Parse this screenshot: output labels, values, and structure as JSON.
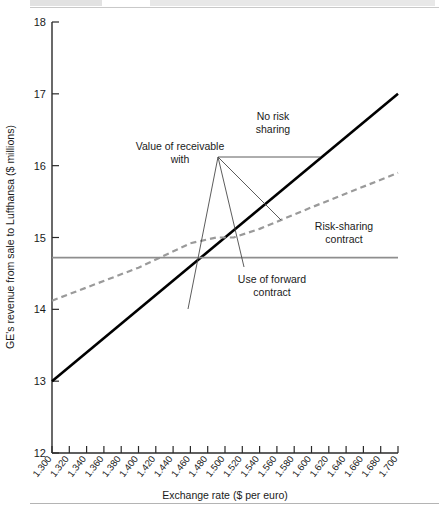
{
  "page": {
    "header_rule_visible": true,
    "footer_rule_visible": true
  },
  "chart_data": {
    "type": "line",
    "title": "",
    "xlabel": "Exchange rate ($ per euro)",
    "ylabel": "GE's revenue from sale to Lufthansa ($ millions)",
    "xlim": [
      1.3,
      1.7
    ],
    "ylim": [
      12,
      18
    ],
    "ytick_step": 1,
    "xtick_step": 0.02,
    "grid": false,
    "legend": "none",
    "yticks": [
      "12",
      "13",
      "14",
      "15",
      "16",
      "17",
      "18"
    ],
    "xticks": [
      "1.300",
      "1.320",
      "1.340",
      "1.360",
      "1.380",
      "1.400",
      "1.420",
      "1.440",
      "1.460",
      "1.480",
      "1.500",
      "1.520",
      "1.540",
      "1.560",
      "1.580",
      "1.600",
      "1.620",
      "1.640",
      "1.660",
      "1.680",
      "1.700"
    ],
    "series": [
      {
        "name": "No risk sharing",
        "style": "solid",
        "color": "#000000",
        "width": 2.6,
        "x": [
          1.3,
          1.7
        ],
        "values": [
          13.0,
          17.0
        ]
      },
      {
        "name": "Risk-sharing contract",
        "style": "dashed",
        "color": "#9a9a9a",
        "width": 2.2,
        "x": [
          1.3,
          1.4,
          1.46,
          1.49,
          1.51,
          1.54,
          1.6,
          1.7
        ],
        "values": [
          14.12,
          14.58,
          14.92,
          15.0,
          15.0,
          15.12,
          15.42,
          15.9
        ]
      },
      {
        "name": "Use of forward contract",
        "style": "solid",
        "color": "#8e8e8e",
        "width": 1.6,
        "x": [
          1.3,
          1.7
        ],
        "values": [
          14.72,
          14.72
        ]
      }
    ],
    "annotations": [
      {
        "id": "value-of-receivable",
        "text_lines": [
          "Value of receivable",
          "with"
        ],
        "x": 1.409,
        "y": 16.3,
        "role": "group-label"
      },
      {
        "id": "no-risk-sharing",
        "text_lines": [
          "No risk",
          "sharing"
        ],
        "x": 1.525,
        "y": 16.73,
        "role": "series-label"
      },
      {
        "id": "risk-sharing-contract",
        "text_lines": [
          "Risk-sharing",
          "contract"
        ],
        "x": 1.612,
        "y": 15.38,
        "role": "series-label"
      },
      {
        "id": "use-of-forward-contract",
        "text_lines": [
          "Use of forward",
          "contract"
        ],
        "x": 1.525,
        "y": 14.42,
        "role": "series-label"
      }
    ],
    "leader_junction": {
      "x": 1.465,
      "y": 16.22
    }
  }
}
